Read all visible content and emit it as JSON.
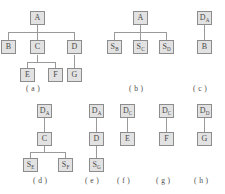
{
  "figure": {
    "background_color": "#ffffff",
    "box_fill_color": "#e2e2e2",
    "box_border_color": "#8c8c8c",
    "edge_color": "#9a9a9a",
    "text_color": "#4a4a4a",
    "diagrams": [
      {
        "id": "a",
        "caption": "( a )",
        "nodes": [
          {
            "id": "a-A",
            "label": "A",
            "sub": ""
          },
          {
            "id": "a-B",
            "label": "B",
            "sub": ""
          },
          {
            "id": "a-C",
            "label": "C",
            "sub": ""
          },
          {
            "id": "a-D",
            "label": "D",
            "sub": ""
          },
          {
            "id": "a-E",
            "label": "E",
            "sub": ""
          },
          {
            "id": "a-F",
            "label": "F",
            "sub": ""
          },
          {
            "id": "a-G",
            "label": "G",
            "sub": ""
          }
        ],
        "edges": [
          {
            "from": "a-A",
            "to": "a-B"
          },
          {
            "from": "a-A",
            "to": "a-C"
          },
          {
            "from": "a-A",
            "to": "a-D"
          },
          {
            "from": "a-C",
            "to": "a-E"
          },
          {
            "from": "a-C",
            "to": "a-F"
          },
          {
            "from": "a-D",
            "to": "a-G"
          }
        ]
      },
      {
        "id": "b",
        "caption": "( b )",
        "nodes": [
          {
            "id": "b-A",
            "label": "A",
            "sub": ""
          },
          {
            "id": "b-SB",
            "label": "S",
            "sub": "B"
          },
          {
            "id": "b-SC",
            "label": "S",
            "sub": "C"
          },
          {
            "id": "b-SD",
            "label": "S",
            "sub": "D"
          }
        ],
        "edges": [
          {
            "from": "b-A",
            "to": "b-SB"
          },
          {
            "from": "b-A",
            "to": "b-SC"
          },
          {
            "from": "b-A",
            "to": "b-SD"
          }
        ]
      },
      {
        "id": "c",
        "caption": "( c )",
        "nodes": [
          {
            "id": "c-DA",
            "label": "D",
            "sub": "A"
          },
          {
            "id": "c-B",
            "label": "B",
            "sub": ""
          }
        ],
        "edges": [
          {
            "from": "c-DA",
            "to": "c-B"
          }
        ]
      },
      {
        "id": "d",
        "caption": "( d )",
        "nodes": [
          {
            "id": "d-DA",
            "label": "D",
            "sub": "A"
          },
          {
            "id": "d-C",
            "label": "C",
            "sub": ""
          },
          {
            "id": "d-SE",
            "label": "S",
            "sub": "E"
          },
          {
            "id": "d-SF",
            "label": "S",
            "sub": "F"
          }
        ],
        "edges": [
          {
            "from": "d-DA",
            "to": "d-C"
          },
          {
            "from": "d-C",
            "to": "d-SE"
          },
          {
            "from": "d-C",
            "to": "d-SF"
          }
        ]
      },
      {
        "id": "e",
        "caption": "( e )",
        "nodes": [
          {
            "id": "e-DA",
            "label": "D",
            "sub": "A"
          },
          {
            "id": "e-D",
            "label": "D",
            "sub": ""
          },
          {
            "id": "e-SG",
            "label": "S",
            "sub": "G"
          }
        ],
        "edges": [
          {
            "from": "e-DA",
            "to": "e-D"
          },
          {
            "from": "e-D",
            "to": "e-SG"
          }
        ]
      },
      {
        "id": "f",
        "caption": "( f )",
        "nodes": [
          {
            "id": "f-DC",
            "label": "D",
            "sub": "C"
          },
          {
            "id": "f-E",
            "label": "E",
            "sub": ""
          }
        ],
        "edges": [
          {
            "from": "f-DC",
            "to": "f-E"
          }
        ]
      },
      {
        "id": "g",
        "caption": "( g )",
        "nodes": [
          {
            "id": "g-DC",
            "label": "D",
            "sub": "C"
          },
          {
            "id": "g-F",
            "label": "F",
            "sub": ""
          }
        ],
        "edges": [
          {
            "from": "g-DC",
            "to": "g-F"
          }
        ]
      },
      {
        "id": "h",
        "caption": "( h )",
        "nodes": [
          {
            "id": "h-DD",
            "label": "D",
            "sub": "D"
          },
          {
            "id": "h-G",
            "label": "G",
            "sub": ""
          }
        ],
        "edges": [
          {
            "from": "h-DD",
            "to": "h-G"
          }
        ]
      }
    ]
  }
}
